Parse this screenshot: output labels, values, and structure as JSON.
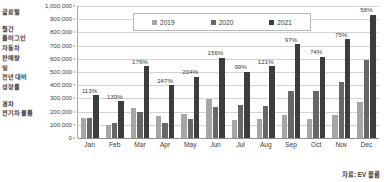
{
  "side_caption": {
    "lines": [
      "글로벌",
      "",
      "월간",
      "플러그인",
      "자동차",
      "판매량",
      "및",
      "전년 대비",
      "성장률",
      "",
      "경차",
      "전기차 볼륨"
    ]
  },
  "legend": {
    "items": [
      {
        "label": "2019",
        "color": "#a6a6a6"
      },
      {
        "label": "2020",
        "color": "#676767"
      },
      {
        "label": "2021",
        "color": "#3d3d3d"
      }
    ]
  },
  "source": {
    "text": "자료: EV 볼륨"
  },
  "chart_data": {
    "type": "bar",
    "title": "",
    "subtitle": "",
    "xlabel": "",
    "ylabel": "",
    "ylim": [
      0,
      1000000
    ],
    "ytick_step": 100000,
    "ytick_labels": [
      "1,000,000",
      "900,000",
      "800,000",
      "700,000",
      "600,000",
      "500,000",
      "400,000",
      "300,000",
      "200,000",
      "100,000",
      "0"
    ],
    "ytick_values": [
      1000000,
      900000,
      800000,
      700000,
      600000,
      500000,
      400000,
      300000,
      200000,
      100000,
      0
    ],
    "grid": true,
    "legend_position": "top-center",
    "categories": [
      "Jan",
      "Feb",
      "Mar",
      "Apr",
      "May",
      "Jun",
      "Jul",
      "Aug",
      "Sep",
      "Oct",
      "Nov",
      "Dec"
    ],
    "series": [
      {
        "name": "2019",
        "color": "#a6a6a6",
        "values": [
          155000,
          95000,
          225000,
          163000,
          180000,
          295000,
          135000,
          147000,
          172000,
          142000,
          172000,
          272000
        ]
      },
      {
        "name": "2020",
        "color": "#676767",
        "values": [
          150000,
          113000,
          196000,
          110000,
          146000,
          235000,
          247000,
          242000,
          355000,
          355000,
          425000,
          590000
        ]
      },
      {
        "name": "2021",
        "color": "#3d3d3d",
        "values": [
          324000,
          278000,
          544000,
          400000,
          463000,
          608000,
          502000,
          542000,
          709000,
          617000,
          747000,
          935000
        ]
      }
    ],
    "annotations": [
      {
        "category": "Jan",
        "label": "113%"
      },
      {
        "category": "Feb",
        "label": "139%"
      },
      {
        "category": "Mar",
        "label": "176%"
      },
      {
        "category": "Apr",
        "label": "247%"
      },
      {
        "category": "May",
        "label": "204%"
      },
      {
        "category": "Jun",
        "label": "156%"
      },
      {
        "category": "Jul",
        "label": "99%"
      },
      {
        "category": "Aug",
        "label": "121%"
      },
      {
        "category": "Sep",
        "label": "97%"
      },
      {
        "category": "Oct",
        "label": "74%"
      },
      {
        "category": "Nov",
        "label": "75%"
      },
      {
        "category": "Dec",
        "label": "58%"
      }
    ]
  }
}
